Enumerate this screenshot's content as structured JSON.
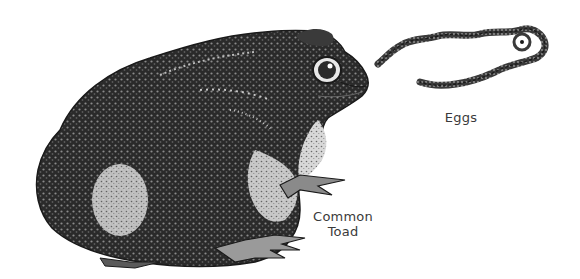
{
  "illustration": {
    "subject": "common-toad-with-eggs",
    "style": "black-and-white stippled engraving",
    "colors": {
      "background": "#ffffff",
      "ink_dark": "#1a1a1a",
      "ink_mid": "#4a4a4a",
      "ink_light": "#9a9a9a",
      "highlight": "#e6e6e6",
      "label_text": "#3a3a3a"
    }
  },
  "labels": {
    "eggs": "Eggs",
    "toad_line1": "Common",
    "toad_line2": "Toad"
  }
}
